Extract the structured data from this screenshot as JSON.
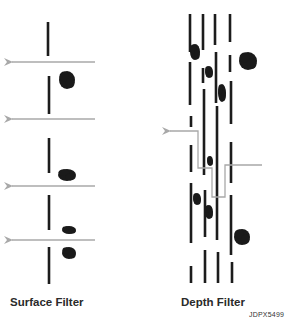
{
  "figure": {
    "labels": {
      "surface": "Surface Filter",
      "depth": "Depth Filter",
      "reference": "JDPX5499"
    },
    "colors": {
      "media": "#1c1c1c",
      "particle": "#1a1a1a",
      "flow_arrow": "#a8a8a8",
      "background": "#ffffff"
    },
    "surface_filter": {
      "media_segments": [
        [
          48,
          22,
          56
        ],
        [
          49,
          76,
          114
        ],
        [
          49,
          138,
          173
        ],
        [
          49,
          195,
          230
        ],
        [
          49,
          247,
          284
        ]
      ],
      "flow_arrows_y": [
        62,
        119,
        186,
        240
      ],
      "particles": [
        {
          "cx": 67,
          "cy": 80,
          "rx": 8,
          "ry": 9
        },
        {
          "cx": 67,
          "cy": 175,
          "rx": 9,
          "ry": 6
        },
        {
          "cx": 69,
          "cy": 230,
          "rx": 7,
          "ry": 4
        },
        {
          "cx": 69,
          "cy": 253,
          "rx": 7,
          "ry": 6
        }
      ]
    },
    "depth_filter": {
      "media_segments": [
        [
          190,
          14,
          52
        ],
        [
          190,
          62,
          105
        ],
        [
          191,
          116,
          127
        ],
        [
          191,
          145,
          172
        ],
        [
          191,
          183,
          243
        ],
        [
          191,
          266,
          283
        ],
        [
          203,
          14,
          50
        ],
        [
          203,
          68,
          83
        ],
        [
          204,
          89,
          175
        ],
        [
          205,
          190,
          237
        ],
        [
          205,
          250,
          283
        ],
        [
          215,
          14,
          45
        ],
        [
          216,
          52,
          103
        ],
        [
          217,
          106,
          240
        ],
        [
          218,
          252,
          283
        ],
        [
          230,
          14,
          42
        ],
        [
          230,
          55,
          72
        ],
        [
          231,
          81,
          124
        ],
        [
          231,
          142,
          183
        ],
        [
          231,
          195,
          255
        ],
        [
          232,
          262,
          283
        ]
      ],
      "particles": [
        {
          "cx": 195,
          "cy": 52,
          "rx": 5,
          "ry": 8
        },
        {
          "cx": 209,
          "cy": 72,
          "rx": 4,
          "ry": 6
        },
        {
          "cx": 222,
          "cy": 93,
          "rx": 4,
          "ry": 9
        },
        {
          "cx": 248,
          "cy": 61,
          "rx": 9,
          "ry": 9
        },
        {
          "cx": 210,
          "cy": 161,
          "rx": 3,
          "ry": 5
        },
        {
          "cx": 197,
          "cy": 199,
          "rx": 4,
          "ry": 6
        },
        {
          "cx": 209,
          "cy": 212,
          "rx": 4,
          "ry": 7
        },
        {
          "cx": 242,
          "cy": 237,
          "rx": 8,
          "ry": 8
        }
      ],
      "flow_path": "262,165 225,165 225,197 212,197 212,168 198,168 198,131 170,131"
    }
  }
}
